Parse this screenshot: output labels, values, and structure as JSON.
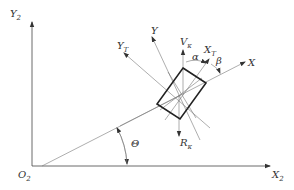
{
  "diagram": {
    "type": "coordinate-frame-schematic",
    "labels": {
      "origin": {
        "main": "O",
        "sub": "2"
      },
      "x_axis": {
        "main": "X",
        "sub": "2"
      },
      "y_axis": {
        "main": "Y",
        "sub": "2"
      },
      "body_x": {
        "main": "X",
        "sub": ""
      },
      "body_y": {
        "main": "Y",
        "sub": ""
      },
      "traj_x": {
        "main": "X",
        "sub": "T"
      },
      "traj_y": {
        "main": "Y",
        "sub": "T"
      },
      "velocity": {
        "main": "V",
        "sub": "κ"
      },
      "reaction": {
        "main": "R",
        "sub": "κ"
      },
      "alpha": "α",
      "beta": "β",
      "theta": "Θ"
    },
    "colors": {
      "line": "#444444",
      "box": "#222222",
      "background": "#ffffff"
    }
  }
}
